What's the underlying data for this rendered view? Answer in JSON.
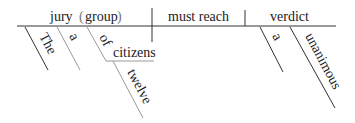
{
  "diagram": {
    "type": "sentence-diagram",
    "subject": {
      "word": "jury",
      "note_open": "(",
      "note": "group",
      "note_close": ")"
    },
    "verb": "must reach",
    "object": "verdict",
    "subject_modifiers": [
      "The",
      "a"
    ],
    "prepositional_phrase": {
      "preposition": "of",
      "object": "citizens",
      "modifier": "twelve"
    },
    "object_modifiers": [
      "a",
      "unanimous"
    ]
  }
}
